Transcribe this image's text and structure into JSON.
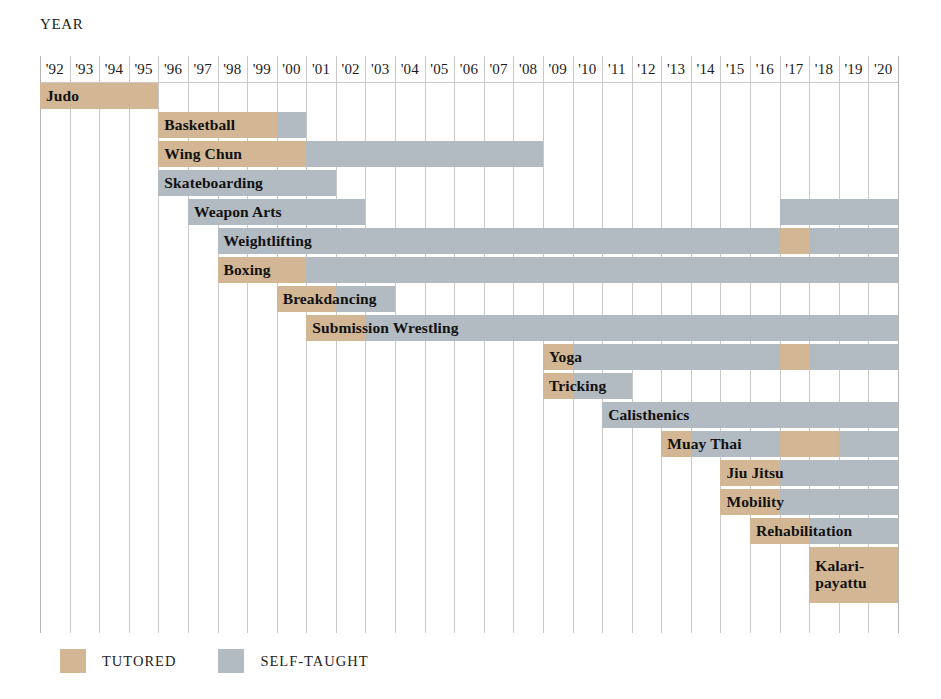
{
  "axis": {
    "title": "YEAR"
  },
  "legend": {
    "items": [
      {
        "label": "TUTORED",
        "key": "tutored",
        "color": "#d3b795"
      },
      {
        "label": "SELF-TAUGHT",
        "key": "self",
        "color": "#b2bac2"
      }
    ]
  },
  "colors": {
    "tutored": "#d3b795",
    "self_taught": "#b2bac2",
    "gridline": "#c9c9c9",
    "background": "#ffffff",
    "text": "#1b1b1b"
  },
  "chart_data": {
    "type": "bar",
    "title": "",
    "subtitle": "",
    "xlabel": "YEAR",
    "ylabel": "",
    "grid": true,
    "legend_position": "bottom-left",
    "x_tick_labels": [
      "'92",
      "'93",
      "'94",
      "'95",
      "'96",
      "'97",
      "'98",
      "'99",
      "'00",
      "'01",
      "'02",
      "'03",
      "'04",
      "'05",
      "'06",
      "'07",
      "'08",
      "'09",
      "'10",
      "'11",
      "'12",
      "'13",
      "'14",
      "'15",
      "'16",
      "'17",
      "'18",
      "'19",
      "'20"
    ],
    "x_years": [
      1992,
      1993,
      1994,
      1995,
      1996,
      1997,
      1998,
      1999,
      2000,
      2001,
      2002,
      2003,
      2004,
      2005,
      2006,
      2007,
      2008,
      2009,
      2010,
      2011,
      2012,
      2013,
      2014,
      2015,
      2016,
      2017,
      2018,
      2019,
      2020
    ],
    "xlim": [
      1992,
      2021
    ],
    "series_keys": [
      "tutored",
      "self"
    ],
    "activities": [
      {
        "name": "Judo",
        "label_lines": [
          "Judo"
        ],
        "segments": [
          {
            "type": "tutored",
            "start": 1992,
            "end": 1996
          }
        ]
      },
      {
        "name": "Basketball",
        "label_lines": [
          "Basketball"
        ],
        "segments": [
          {
            "type": "tutored",
            "start": 1996,
            "end": 2000
          },
          {
            "type": "self",
            "start": 2000,
            "end": 2001
          }
        ]
      },
      {
        "name": "Wing Chun",
        "label_lines": [
          "Wing Chun"
        ],
        "segments": [
          {
            "type": "tutored",
            "start": 1996,
            "end": 2001
          },
          {
            "type": "self",
            "start": 2001,
            "end": 2009
          }
        ]
      },
      {
        "name": "Skateboarding",
        "label_lines": [
          "Skateboarding"
        ],
        "segments": [
          {
            "type": "self",
            "start": 1996,
            "end": 2002
          }
        ]
      },
      {
        "name": "Weapon Arts",
        "label_lines": [
          "Weapon Arts"
        ],
        "segments": [
          {
            "type": "self",
            "start": 1997,
            "end": 2003
          },
          {
            "type": "self",
            "start": 2017,
            "end": 2021
          }
        ]
      },
      {
        "name": "Weightlifting",
        "label_lines": [
          "Weightlifting"
        ],
        "segments": [
          {
            "type": "self",
            "start": 1998,
            "end": 2017
          },
          {
            "type": "tutored",
            "start": 2017,
            "end": 2018
          },
          {
            "type": "self",
            "start": 2018,
            "end": 2021
          }
        ]
      },
      {
        "name": "Boxing",
        "label_lines": [
          "Boxing"
        ],
        "segments": [
          {
            "type": "tutored",
            "start": 1998,
            "end": 2001
          },
          {
            "type": "self",
            "start": 2001,
            "end": 2021
          }
        ]
      },
      {
        "name": "Breakdancing",
        "label_lines": [
          "Breakdancing"
        ],
        "segments": [
          {
            "type": "tutored",
            "start": 2000,
            "end": 2002
          },
          {
            "type": "self",
            "start": 2002,
            "end": 2004
          }
        ]
      },
      {
        "name": "Submission Wrestling",
        "label_lines": [
          "Submission Wrestling"
        ],
        "segments": [
          {
            "type": "tutored",
            "start": 2001,
            "end": 2003
          },
          {
            "type": "self",
            "start": 2003,
            "end": 2021
          }
        ]
      },
      {
        "name": "Yoga",
        "label_lines": [
          "Yoga"
        ],
        "segments": [
          {
            "type": "tutored",
            "start": 2009,
            "end": 2010
          },
          {
            "type": "self",
            "start": 2010,
            "end": 2017
          },
          {
            "type": "tutored",
            "start": 2017,
            "end": 2018
          },
          {
            "type": "self",
            "start": 2018,
            "end": 2021
          }
        ]
      },
      {
        "name": "Tricking",
        "label_lines": [
          "Tricking"
        ],
        "segments": [
          {
            "type": "tutored",
            "start": 2009,
            "end": 2010
          },
          {
            "type": "self",
            "start": 2010,
            "end": 2012
          }
        ]
      },
      {
        "name": "Calisthenics",
        "label_lines": [
          "Calisthenics"
        ],
        "segments": [
          {
            "type": "self",
            "start": 2011,
            "end": 2021
          }
        ]
      },
      {
        "name": "Muay Thai",
        "label_lines": [
          "Muay Thai"
        ],
        "segments": [
          {
            "type": "tutored",
            "start": 2013,
            "end": 2014
          },
          {
            "type": "self",
            "start": 2014,
            "end": 2017
          },
          {
            "type": "tutored",
            "start": 2017,
            "end": 2019
          },
          {
            "type": "self",
            "start": 2019,
            "end": 2021
          }
        ]
      },
      {
        "name": "Jiu Jitsu",
        "label_lines": [
          "Jiu Jitsu"
        ],
        "segments": [
          {
            "type": "tutored",
            "start": 2015,
            "end": 2017
          },
          {
            "type": "self",
            "start": 2017,
            "end": 2021
          }
        ]
      },
      {
        "name": "Mobility",
        "label_lines": [
          "Mobility"
        ],
        "segments": [
          {
            "type": "tutored",
            "start": 2015,
            "end": 2017
          },
          {
            "type": "self",
            "start": 2017,
            "end": 2021
          }
        ]
      },
      {
        "name": "Rehabilitation",
        "label_lines": [
          "Rehabilitation"
        ],
        "segments": [
          {
            "type": "tutored",
            "start": 2016,
            "end": 2018
          },
          {
            "type": "self",
            "start": 2018,
            "end": 2021
          }
        ]
      },
      {
        "name": "Kalaripayattu",
        "label_lines": [
          "Kalari-",
          "payattu"
        ],
        "segments": [
          {
            "type": "tutored",
            "start": 2018,
            "end": 2021
          }
        ]
      }
    ]
  }
}
